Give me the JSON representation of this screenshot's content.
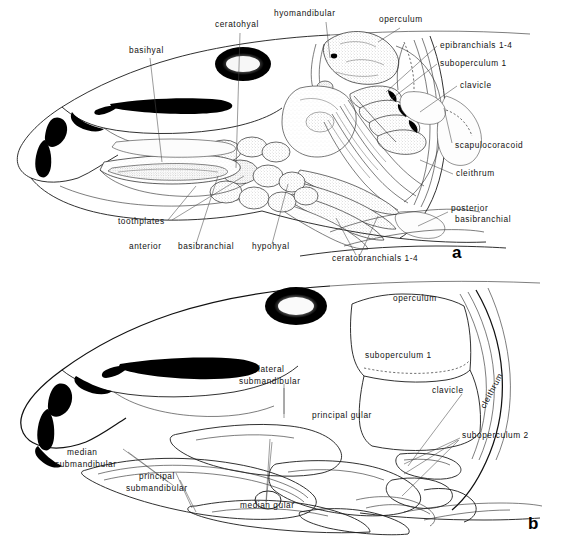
{
  "figure": {
    "background_color": "#ffffff",
    "ink_color": "#111111",
    "width": 564,
    "height": 537
  },
  "panel_a": {
    "letter": "a",
    "description": "Branchial and hyoid skeleton in lateral view, stippled bones",
    "labels": [
      {
        "id": "basihyal",
        "text": "basihyal",
        "x": 129,
        "y": 53,
        "anchor": "start"
      },
      {
        "id": "ceratohyal",
        "text": "ceratohyal",
        "x": 215,
        "y": 27,
        "anchor": "start"
      },
      {
        "id": "hyomandibular",
        "text": "hyomandibular",
        "x": 274,
        "y": 16,
        "anchor": "start"
      },
      {
        "id": "operculum",
        "text": "operculum",
        "x": 379,
        "y": 22,
        "anchor": "start"
      },
      {
        "id": "epibranchials",
        "text": "epibranchials 1-4",
        "x": 440,
        "y": 48,
        "anchor": "start"
      },
      {
        "id": "suboperculum-1",
        "text": "suboperculum 1",
        "x": 440,
        "y": 66,
        "anchor": "start"
      },
      {
        "id": "clavicle",
        "text": "clavicle",
        "x": 460,
        "y": 88,
        "anchor": "start"
      },
      {
        "id": "scapulocoracoid",
        "text": "scapulocoracoid",
        "x": 455,
        "y": 148,
        "anchor": "start"
      },
      {
        "id": "cleithrum",
        "text": "cleithrum",
        "x": 456,
        "y": 176,
        "anchor": "start"
      },
      {
        "id": "posterior",
        "text": "posterior",
        "x": 451,
        "y": 211,
        "anchor": "start"
      },
      {
        "id": "basibranchial-post",
        "text": "basibranchial",
        "x": 455,
        "y": 222,
        "anchor": "start"
      },
      {
        "id": "toothplates",
        "text": "toothplates",
        "x": 118,
        "y": 224,
        "anchor": "start"
      },
      {
        "id": "anterior",
        "text": "anterior",
        "x": 129,
        "y": 249,
        "anchor": "start"
      },
      {
        "id": "basibranchial-ant",
        "text": "basibranchial",
        "x": 178,
        "y": 249,
        "anchor": "start"
      },
      {
        "id": "hypohyal",
        "text": "hypohyal",
        "x": 252,
        "y": 249,
        "anchor": "start"
      },
      {
        "id": "ceratobranchials",
        "text": "ceratobranchials 1-4",
        "x": 332,
        "y": 261,
        "anchor": "start"
      }
    ]
  },
  "panel_b": {
    "letter": "b",
    "description": "External dermal bones and gular plates in lateral view",
    "labels": [
      {
        "id": "operculum",
        "text": "operculum",
        "x": 393,
        "y": 301,
        "anchor": "start"
      },
      {
        "id": "suboperculum-1",
        "text": "suboperculum 1",
        "x": 365,
        "y": 358,
        "anchor": "start"
      },
      {
        "id": "lateral",
        "text": "lateral",
        "x": 258,
        "y": 372,
        "anchor": "start"
      },
      {
        "id": "submandibular-lat",
        "text": "submandibular",
        "x": 239,
        "y": 384,
        "anchor": "start"
      },
      {
        "id": "clavicle",
        "text": "clavicle",
        "x": 432,
        "y": 393,
        "anchor": "start"
      },
      {
        "id": "cleithrum",
        "text": "cleithrum",
        "x": 494,
        "y": 392,
        "anchor": "middle",
        "rotate": -62
      },
      {
        "id": "principal-gular",
        "text": "principal gular",
        "x": 312,
        "y": 418,
        "anchor": "start"
      },
      {
        "id": "suboperculum-2",
        "text": "suboperculum 2",
        "x": 462,
        "y": 438,
        "anchor": "start"
      },
      {
        "id": "median",
        "text": "median",
        "x": 67,
        "y": 455,
        "anchor": "start"
      },
      {
        "id": "submandibular-med",
        "text": "submandibular",
        "x": 55,
        "y": 467,
        "anchor": "start"
      },
      {
        "id": "principal",
        "text": "principal",
        "x": 139,
        "y": 479,
        "anchor": "start"
      },
      {
        "id": "submandibular-pri",
        "text": "submandibular",
        "x": 126,
        "y": 491,
        "anchor": "start"
      },
      {
        "id": "median-gular",
        "text": "median gular",
        "x": 240,
        "y": 508,
        "anchor": "start"
      }
    ]
  }
}
